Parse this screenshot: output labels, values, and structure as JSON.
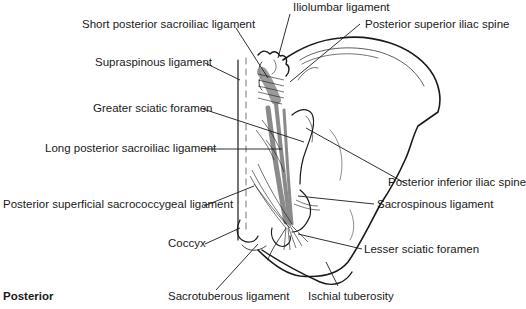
{
  "figure": {
    "view_label": "Posterior",
    "labels": [
      {
        "id": "iliolumbar",
        "text": "Iliolumbar ligament"
      },
      {
        "id": "short-post-si",
        "text": "Short posterior sacroiliac ligament"
      },
      {
        "id": "psis",
        "text": "Posterior superior iliac spine"
      },
      {
        "id": "supraspinous",
        "text": "Supraspinous ligament"
      },
      {
        "id": "greater-sciatic",
        "text": "Greater sciatic foramen"
      },
      {
        "id": "long-post-si",
        "text": "Long posterior sacroiliac ligament"
      },
      {
        "id": "pis",
        "text": "Posterior inferior iliac spine"
      },
      {
        "id": "post-sup-sacrococcygeal",
        "text": "Posterior superficial sacrococcygeal ligament"
      },
      {
        "id": "sacrospinous",
        "text": "Sacrospinous ligament"
      },
      {
        "id": "coccyx",
        "text": "Coccyx"
      },
      {
        "id": "lesser-sciatic",
        "text": "Lesser sciatic foramen"
      },
      {
        "id": "sacrotuberous",
        "text": "Sacrotuberous ligament"
      },
      {
        "id": "ischial-tuberosity",
        "text": "Ischial tuberosity"
      }
    ]
  },
  "colors": {
    "line": "#1a1a1a",
    "ligament_fill": "#8a8a8a",
    "background": "#ffffff"
  }
}
